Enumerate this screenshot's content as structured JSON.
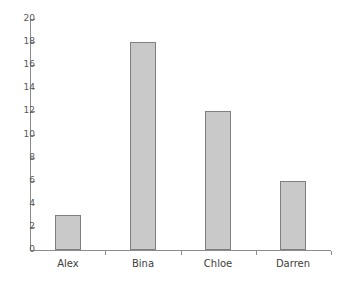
{
  "chart_data": {
    "type": "bar",
    "title": "",
    "subtitle": "",
    "xlabel": "",
    "ylabel": "",
    "categories": [
      "Alex",
      "Bina",
      "Chloe",
      "Darren"
    ],
    "values": [
      3,
      18,
      12,
      6
    ],
    "ylim": [
      0,
      20
    ],
    "y_ticks": [
      0,
      2,
      4,
      6,
      8,
      10,
      12,
      14,
      16,
      18,
      20
    ],
    "y_tick_labels": [
      "0",
      "2",
      "4",
      "6",
      "8",
      "10",
      "12",
      "14",
      "16",
      "18",
      "20"
    ],
    "grid": false,
    "legend": null,
    "legend_position": "none",
    "annotations": [],
    "colors": {
      "bar_fill": "#c9c9c9",
      "bar_border": "#7f7f7f",
      "axis": "#8c8c8c",
      "tick_label": "#595959",
      "category_label": "#3d3d3d",
      "background": "#ffffff"
    }
  }
}
